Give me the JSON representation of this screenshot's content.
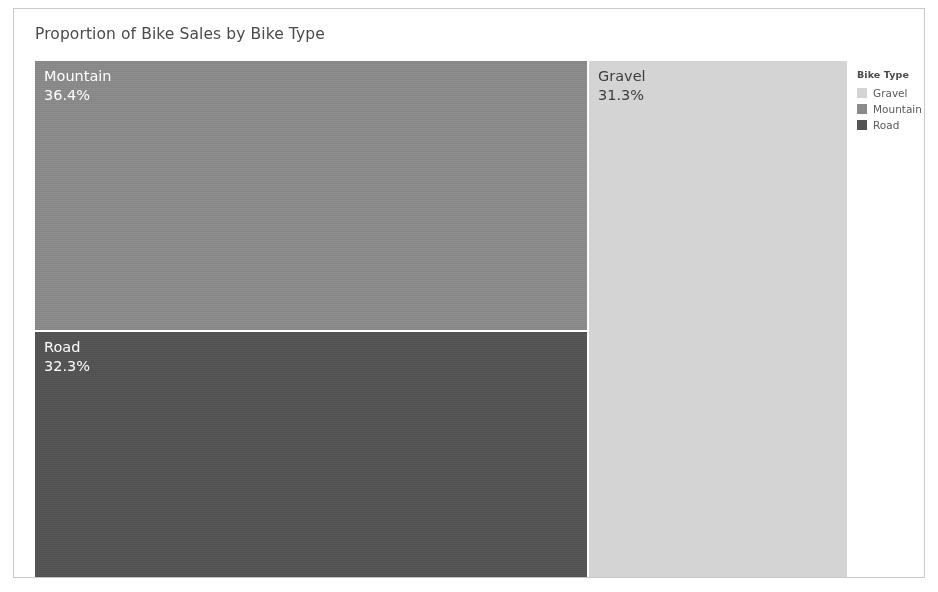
{
  "chart": {
    "title": "Proportion of Bike Sales by Bike Type"
  },
  "legend": {
    "title": "Bike Type",
    "items": [
      {
        "label": "Gravel",
        "color": "#d4d4d4"
      },
      {
        "label": "Mountain",
        "color": "#8a8a8a"
      },
      {
        "label": "Road",
        "color": "#545454"
      }
    ]
  },
  "tiles": [
    {
      "key": "mountain",
      "category": "Mountain",
      "percent_label": "36.4%",
      "color": "#8a8a8a",
      "text_color": "#ffffff"
    },
    {
      "key": "road",
      "category": "Road",
      "percent_label": "32.3%",
      "color": "#545454",
      "text_color": "#ffffff"
    },
    {
      "key": "gravel",
      "category": "Gravel",
      "percent_label": "31.3%",
      "color": "#d4d4d4",
      "text_color": "#3d3d3d"
    }
  ],
  "chart_data": {
    "type": "treemap",
    "title": "Proportion of Bike Sales by Bike Type",
    "xlabel": "",
    "ylabel": "",
    "categories": [
      "Mountain",
      "Road",
      "Gravel"
    ],
    "values": [
      36.4,
      32.3,
      31.3
    ],
    "value_unit": "percent",
    "data_labels": [
      "36.4%",
      "32.3%",
      "31.3%"
    ],
    "colors": [
      "#8a8a8a",
      "#545454",
      "#d4d4d4"
    ],
    "legend": {
      "title": "Bike Type",
      "position": "right",
      "entries": [
        "Gravel",
        "Mountain",
        "Road"
      ]
    },
    "grid": false,
    "series": [
      {
        "name": "Proportion of Bike Sales",
        "points": [
          {
            "category": "Mountain",
            "value": 36.4,
            "label": "36.4%"
          },
          {
            "category": "Road",
            "value": 32.3,
            "label": "32.3%"
          },
          {
            "category": "Gravel",
            "value": 31.3,
            "label": "31.3%"
          }
        ]
      }
    ]
  }
}
